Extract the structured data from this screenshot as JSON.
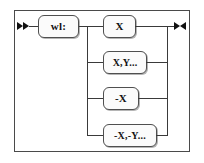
{
  "diagram": {
    "type": "railroad-syntax-diagram",
    "title": "",
    "background_color": "#ffffff",
    "line_color": "#3a3a3a",
    "frame_color": "#4a4a4a",
    "box_fill_color": "#fbfbfb",
    "text_color": "#121212",
    "start_marker": "double-right-arrow",
    "end_marker": "right-left-arrow-pair",
    "prefix": {
      "label": "wl:"
    },
    "alternatives": [
      {
        "label": "X"
      },
      {
        "label": "X,Y..."
      },
      {
        "label": "-X"
      },
      {
        "label": "-X,-Y..."
      }
    ]
  }
}
